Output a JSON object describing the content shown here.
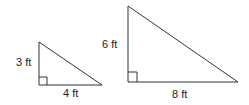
{
  "diagram": {
    "small_triangle": {
      "leg_vertical_label": "3 ft",
      "leg_horizontal_label": "4 ft"
    },
    "large_triangle": {
      "leg_vertical_label": "6 ft",
      "leg_horizontal_label": "8 ft"
    },
    "colors": {
      "stroke": "#333333",
      "text": "#222222",
      "background": "#ffffff"
    }
  }
}
